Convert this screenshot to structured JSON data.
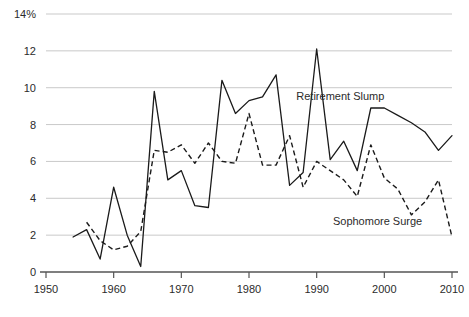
{
  "chart_data": {
    "type": "line",
    "title": "",
    "xlabel": "",
    "ylabel": "",
    "xlim": [
      1950,
      2010
    ],
    "ylim": [
      0,
      14
    ],
    "grid": true,
    "legend_position": "inline-annotations",
    "y_ticks": [
      0,
      2,
      4,
      6,
      8,
      10,
      12,
      14
    ],
    "y_tick_labels": [
      "0",
      "2",
      "4",
      "6",
      "8",
      "10",
      "12",
      "14%"
    ],
    "x_ticks": [
      1950,
      1960,
      1970,
      1980,
      1990,
      2000,
      2010
    ],
    "x_tick_labels": [
      "1950",
      "1960",
      "1970",
      "1980",
      "1990",
      "2000",
      "2010"
    ],
    "series": [
      {
        "name": "Retirement Slump",
        "style": "solid",
        "color": "#1a1a1a",
        "annotation": "Retirement Slump",
        "annotation_x": 1993.5,
        "annotation_y": 9.35,
        "x": [
          1954,
          1956,
          1958,
          1960,
          1962,
          1964,
          1966,
          1968,
          1970,
          1972,
          1974,
          1976,
          1978,
          1980,
          1982,
          1984,
          1986,
          1988,
          1990,
          1992,
          1994,
          1996,
          1998,
          2000,
          2002,
          2004,
          2006,
          2008,
          2010
        ],
        "values": [
          1.9,
          2.3,
          0.7,
          4.6,
          2.0,
          0.3,
          9.8,
          5.0,
          5.5,
          3.6,
          3.5,
          10.4,
          8.6,
          9.3,
          9.5,
          10.7,
          4.7,
          5.4,
          12.1,
          6.1,
          7.1,
          5.5,
          8.9,
          8.9,
          8.5,
          8.1,
          7.6,
          6.6,
          7.4
        ]
      },
      {
        "name": "Sophomore Surge",
        "style": "dashed",
        "color": "#1a1a1a",
        "annotation": "Sophomore Surge",
        "annotation_x": 1999.0,
        "annotation_y": 2.55,
        "x": [
          1956,
          1958,
          1960,
          1962,
          1964,
          1966,
          1968,
          1970,
          1972,
          1974,
          1976,
          1978,
          1980,
          1982,
          1984,
          1986,
          1988,
          1990,
          1992,
          1994,
          1996,
          1998,
          2000,
          2002,
          2004,
          2006,
          2008,
          2010
        ],
        "values": [
          2.7,
          1.7,
          1.2,
          1.4,
          2.2,
          6.6,
          6.5,
          6.9,
          5.9,
          7.0,
          6.0,
          5.9,
          8.6,
          5.8,
          5.8,
          7.4,
          4.6,
          6.0,
          5.5,
          5.0,
          4.1,
          6.9,
          5.1,
          4.5,
          3.1,
          3.8,
          5.0,
          1.9
        ]
      }
    ]
  }
}
